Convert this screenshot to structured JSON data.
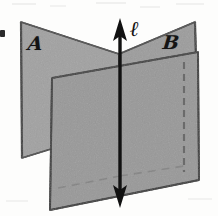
{
  "figure": {
    "caption_type": "geometry-diagram",
    "labels": {
      "plane_a": "ℬ",
      "plane_a_text": "A",
      "plane_b_text": "B",
      "line_text": "ℓ"
    },
    "colors": {
      "plane_fill": "#9b9b9b",
      "plane_fill_front": "#989898",
      "plane_fill_back_left": "#a2a2a2",
      "plane_edge": "#4a4a4a",
      "line_stroke": "#111111",
      "hidden_edge": "#6e6e6e",
      "background": "#fdfdfc"
    },
    "geometry": {
      "plane_a_points": "21,22 119,54 119,128 22,158",
      "plane_b_points": "119,54 195,22 198,132 119,128",
      "front_plane_points": "52,78 198,52 199,180 50,210",
      "line_top": "120,20",
      "line_bottom": "120,206",
      "hidden_edge_top": "184,62",
      "hidden_edge_bottom": "184,170"
    },
    "annotations": {
      "plane_a_name": "plane A",
      "plane_b_name": "plane B",
      "line_name": "line l"
    }
  }
}
